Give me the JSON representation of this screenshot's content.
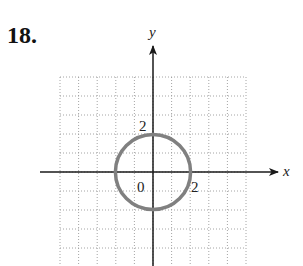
{
  "problem": {
    "number": "18."
  },
  "chart_data": {
    "type": "scatter",
    "title": "",
    "xlabel": "x",
    "ylabel": "y",
    "xlim": [
      -5,
      5
    ],
    "ylim": [
      -5,
      5
    ],
    "grid": true,
    "grid_style": "dotted",
    "tick_labels": {
      "origin": "0",
      "x_tick": "2",
      "y_tick": "2"
    },
    "curves": [
      {
        "shape": "circle",
        "center": [
          0,
          0
        ],
        "radius": 2,
        "equation": "x^2 + y^2 = 4",
        "color": "#808080"
      }
    ],
    "colors": {
      "axis": "#1a1a1a",
      "grid": "#9a9a9a",
      "curve": "#808080"
    }
  }
}
